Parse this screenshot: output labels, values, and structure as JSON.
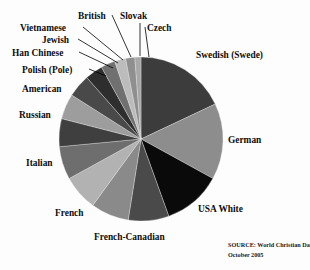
{
  "figure": {
    "background_color": "#fdfdfd",
    "width": 310,
    "height": 270
  },
  "source_note": {
    "line1": "SOURCE: World Christian Database.",
    "line2": "October 2005"
  },
  "chart_data": {
    "type": "pie",
    "title": "",
    "xlabel": "",
    "ylabel": "",
    "legend_position": "callout-labels",
    "grid": false,
    "center": {
      "x": 141,
      "y": 139
    },
    "radius": 82,
    "start_angle_deg": -90,
    "direction": "clockwise",
    "categories": [
      "Swedish (Swede)",
      "German",
      "USA White",
      "French-Canadian",
      "French",
      "Italian",
      "Russian",
      "American",
      "Polish (Pole)",
      "Han Chinese",
      "Jewish",
      "Vietnamese",
      "British",
      "Slovak",
      "Czech"
    ],
    "values": [
      18.0,
      15.0,
      11.5,
      8.0,
      7.5,
      7.0,
      6.5,
      5.5,
      5.0,
      4.5,
      3.5,
      2.8,
      2.2,
      1.8,
      1.2
    ],
    "colors": [
      "#3c3c3c",
      "#8d8d8d",
      "#0a0a0a",
      "#4a4a4a",
      "#8a8a8a",
      "#b2b2b2",
      "#6e6e6e",
      "#3f3f3f",
      "#9d9d9d",
      "#494949",
      "#2e2e2e",
      "#707070",
      "#bcbcbc",
      "#8f8f8f",
      "#a8a8a8"
    ],
    "labels": [
      {
        "text": "Swedish (Swede)",
        "x": 196,
        "y": 58,
        "anchor": "start",
        "size": 9.4,
        "leader": null
      },
      {
        "text": "German",
        "x": 228,
        "y": 143,
        "anchor": "start",
        "size": 9.4,
        "leader": null
      },
      {
        "text": "USA White",
        "x": 198,
        "y": 212,
        "anchor": "start",
        "size": 9.4,
        "leader": null
      },
      {
        "text": "French-Canadian",
        "x": 94,
        "y": 240,
        "anchor": "start",
        "size": 9.4,
        "leader": null
      },
      {
        "text": "French",
        "x": 55,
        "y": 216,
        "anchor": "start",
        "size": 9.4,
        "leader": null
      },
      {
        "text": "Italian",
        "x": 26,
        "y": 166,
        "anchor": "start",
        "size": 9.4,
        "leader": null
      },
      {
        "text": "Russian",
        "x": 19,
        "y": 118,
        "anchor": "start",
        "size": 9.4,
        "leader": null
      },
      {
        "text": "American",
        "x": 22,
        "y": 92,
        "anchor": "start",
        "size": 9.4,
        "leader": null
      },
      {
        "text": "Polish (Pole)",
        "x": 22,
        "y": 73,
        "anchor": "start",
        "size": 9.4,
        "leader": [
          [
            89,
            69
          ],
          [
            106,
            76
          ]
        ]
      },
      {
        "text": "Han Chinese",
        "x": 12,
        "y": 56,
        "anchor": "start",
        "size": 9.4,
        "leader": [
          [
            79,
            52
          ],
          [
            113,
            68
          ]
        ]
      },
      {
        "text": "Jewish",
        "x": 42,
        "y": 43,
        "anchor": "start",
        "size": 9.4,
        "leader": [
          [
            78,
            39
          ],
          [
            118,
            63
          ]
        ]
      },
      {
        "text": "Vietnamese",
        "x": 20,
        "y": 31,
        "anchor": "start",
        "size": 9.4,
        "leader": [
          [
            83,
            27
          ],
          [
            123,
            60
          ]
        ]
      },
      {
        "text": "British",
        "x": 78,
        "y": 19,
        "anchor": "start",
        "size": 9.4,
        "leader": [
          [
            112,
            15
          ],
          [
            131,
            57
          ]
        ]
      },
      {
        "text": "Slovak",
        "x": 120,
        "y": 19,
        "anchor": "start",
        "size": 9.4,
        "leader": [
          [
            140,
            23
          ],
          [
            140,
            56
          ]
        ]
      },
      {
        "text": "Czech",
        "x": 147,
        "y": 31,
        "anchor": "start",
        "size": 9.4,
        "leader": [
          [
            145,
            27
          ],
          [
            149,
            57
          ]
        ]
      }
    ]
  }
}
